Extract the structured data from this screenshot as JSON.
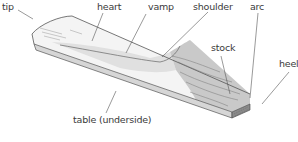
{
  "diagram": {
    "labels": {
      "tip": "tip",
      "heart": "heart",
      "vamp": "vamp",
      "shoulder": "shoulder",
      "arc": "arc",
      "stock": "stock",
      "heel": "heel",
      "table": "table (underside)"
    },
    "colors": {
      "outline": "#555555",
      "vamp_fill": "#f2f2f2",
      "heart_shade": "#dcdcdc",
      "stock_fill": "#c9c9c9",
      "heel_fill": "#8a8a8a",
      "label_text": "#3a3a3a",
      "leader_line": "#555555"
    }
  }
}
